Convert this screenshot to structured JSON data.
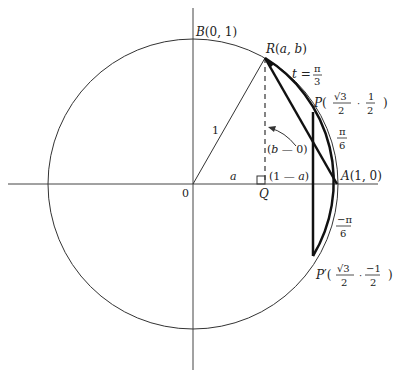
{
  "labels": {
    "B": "B(0, 1)",
    "R": "R(a, b)",
    "t_eq": "t =",
    "pi": "π",
    "three": "3",
    "six": "6",
    "P": "P(",
    "sqrt3": "√3",
    "two": "2",
    "one": "1",
    "comma": "·",
    "close": ")",
    "P_prime": "P′(",
    "neg_half_num": "−1",
    "neg_pi": "−π",
    "radius": "1",
    "b_minus_0": "(b — 0)",
    "one_minus_a": "(1 — a)",
    "a": "a",
    "origin": "0",
    "Q": "Q",
    "A": "A(1, 0)"
  },
  "geometry": {
    "center": [
      193,
      184
    ],
    "radius": 145
  }
}
